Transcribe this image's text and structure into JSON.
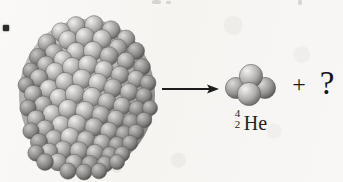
{
  "figure": {
    "name": "alpha-decay-reaction-figure",
    "background_color": "#f7f6f4",
    "ink_color": "#1a1a1a",
    "sphere_color": "#c3c3c3",
    "sphere_shadow_color": "#6e6e6e",
    "sphere_highlight_color": "#ececec"
  },
  "reaction": {
    "parent_nucleus": {
      "label": "",
      "description": "large-nucleus-sphere-packing",
      "nucleon_count_drawn": 132
    },
    "arrow": {
      "symbol": "→",
      "direction": "right"
    },
    "products": [
      {
        "mass_number": "4",
        "atomic_number": "2",
        "element_symbol": "He",
        "plain_label": "4/2 He"
      }
    ],
    "plus_sign": "+",
    "unknown_product": "?"
  }
}
